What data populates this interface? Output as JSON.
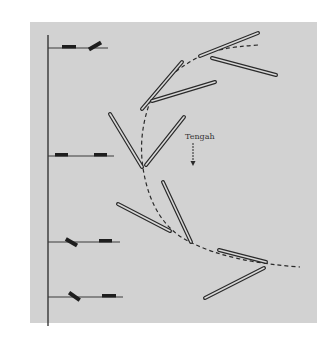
{
  "figure": {
    "type": "motion-sequence-diagram",
    "background_color": "#ffffff",
    "panel_color": "#d2d2d2",
    "ink_color": "#2a2a2a",
    "direction_label": "Tengah",
    "direction_arrow": "down-arrow",
    "timeline": {
      "axis": "vertical",
      "rows": [
        {
          "index": 1,
          "left_block": "flat",
          "right_block": "tilted-up"
        },
        {
          "index": 2,
          "left_block": "flat",
          "right_block": "flat"
        },
        {
          "index": 3,
          "left_block": "tilted-down",
          "right_block": "flat"
        },
        {
          "index": 4,
          "left_block": "tilted-down",
          "right_block": "flat"
        }
      ]
    },
    "rod_pairs": [
      {
        "index": 1,
        "position": "top-right"
      },
      {
        "index": 2,
        "position": "upper-middle"
      },
      {
        "index": 3,
        "position": "middle-left"
      },
      {
        "index": 4,
        "position": "lower-middle"
      },
      {
        "index": 5,
        "position": "bottom-right"
      }
    ],
    "trajectory": "dashed-curve"
  }
}
